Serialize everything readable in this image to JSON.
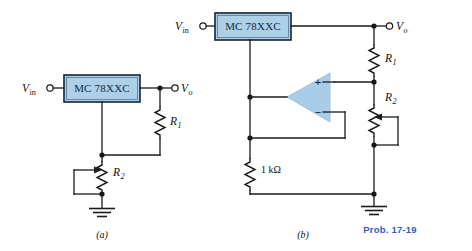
{
  "figure": {
    "caption_tag": "Prob. 17-19",
    "accent_color": "#2b5fbe",
    "ic_fill_color": "#adcfe8",
    "opamp_fill_color": "#a9cde9",
    "wire_color": "#1b1b1b",
    "background": "#ffffff"
  },
  "circuit_a": {
    "sub_caption": "(a)",
    "input_label": "V",
    "input_sub": "in",
    "output_label": "V",
    "output_sub": "o",
    "regulator_label": "MC 78XXC",
    "r1_label": "R",
    "r1_sub": "1",
    "r2_label": "R",
    "r2_sub": "2",
    "ground_name": "ground"
  },
  "circuit_b": {
    "sub_caption": "(b)",
    "input_label": "V",
    "input_sub": "in",
    "output_label": "V",
    "output_sub": "o",
    "regulator_label": "MC 78XXC",
    "r1_label": "R",
    "r1_sub": "1",
    "r2_label": "R",
    "r2_sub": "2",
    "r3_value": "1 kΩ",
    "opamp_plus": "+",
    "opamp_minus": "−",
    "ground_name": "ground"
  }
}
